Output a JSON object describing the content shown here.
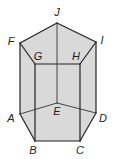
{
  "figure": {
    "type": "pentagonal-prism",
    "colors": {
      "face_fill": "#d9d9d9",
      "edge_stroke": "#222222",
      "background": "#ffffff"
    },
    "vertices": {
      "J": {
        "label": "J",
        "x": 57,
        "y": 23,
        "lx": 57,
        "ly": 13
      },
      "F": {
        "label": "F",
        "x": 20,
        "y": 43,
        "lx": 11,
        "ly": 42
      },
      "I": {
        "label": "I",
        "x": 96,
        "y": 42,
        "lx": 102,
        "ly": 41
      },
      "G": {
        "label": "G",
        "x": 35,
        "y": 64,
        "lx": 38,
        "ly": 57
      },
      "H": {
        "label": "H",
        "x": 80,
        "y": 64,
        "lx": 76,
        "ly": 57
      },
      "A": {
        "label": "A",
        "x": 20,
        "y": 114,
        "lx": 11,
        "ly": 119
      },
      "E": {
        "label": "E",
        "x": 57,
        "y": 103,
        "lx": 57,
        "ly": 112
      },
      "D": {
        "label": "D",
        "x": 96,
        "y": 113,
        "lx": 103,
        "ly": 119
      },
      "B": {
        "label": "B",
        "x": 35,
        "y": 141,
        "lx": 33,
        "ly": 151
      },
      "C": {
        "label": "C",
        "x": 80,
        "y": 141,
        "lx": 80,
        "ly": 151
      }
    }
  }
}
